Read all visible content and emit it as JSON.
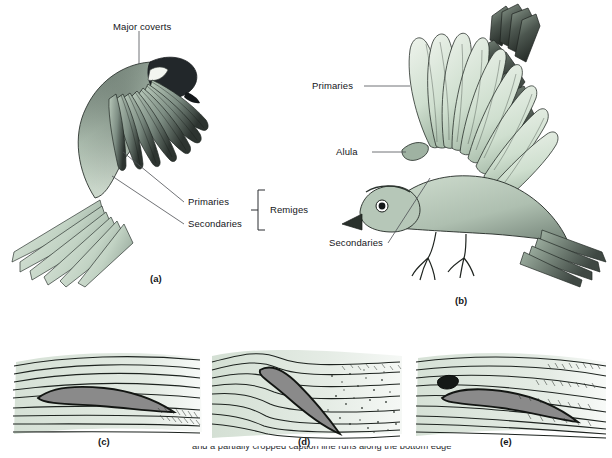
{
  "figure": {
    "background_color": "#ffffff",
    "ink_color": "#15161a",
    "plumage_green": "#c6d6c8",
    "plumage_green_light": "#dfe8de",
    "plumage_dark": "#4a5450",
    "airfoil_body_color": "#8a8a8a",
    "airflow_tint": "#cfdccf"
  },
  "panels": [
    {
      "id": "a",
      "letter": "(a)",
      "subject": "bird-in-flight-dorsal-wing-detail",
      "labels": [
        {
          "name": "major-coverts",
          "text": "Major coverts"
        },
        {
          "name": "primaries",
          "text": "Primaries"
        },
        {
          "name": "secondaries",
          "text": "Secondaries"
        }
      ],
      "bracket": {
        "name": "remiges-bracket",
        "text": "Remiges"
      }
    },
    {
      "id": "b",
      "letter": "(b)",
      "subject": "bird-with-spread-wing-lateral",
      "labels": [
        {
          "name": "primaries",
          "text": "Primaries"
        },
        {
          "name": "alula",
          "text": "Alula"
        },
        {
          "name": "secondaries",
          "text": "Secondaries"
        }
      ]
    },
    {
      "id": "c",
      "letter": "(c)",
      "subject": "airfoil-low-angle-of-attack-smooth-flow"
    },
    {
      "id": "d",
      "letter": "(d)",
      "subject": "airfoil-high-angle-of-attack-stall-turbulence"
    },
    {
      "id": "e",
      "letter": "(e)",
      "subject": "airfoil-with-alula-slot-restored-flow"
    }
  ],
  "caption": {
    "partial_line": "and a partially cropped caption line runs along the bottom edge"
  }
}
